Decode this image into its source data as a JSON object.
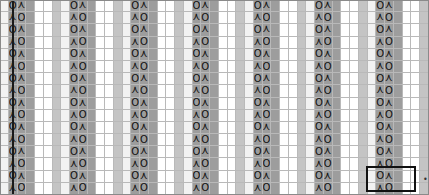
{
  "chart": {
    "type": "knitting-chart",
    "grid": {
      "columns": 49,
      "rows": 16,
      "cell_width_px": 8.75,
      "cell_height_px": 12.1875,
      "gridline_color": "#b9b9b9",
      "border_color": "#8a8a8a"
    },
    "repeat": {
      "width_columns": 7,
      "count": 7,
      "boundary_marker_x_px": 12,
      "boundary_marker_color": "#1a1a1a",
      "boundary_marker_width_px": 2
    },
    "colors": {
      "white": "#ffffff",
      "light": "#f2f2f2",
      "medium": "#c4c4c4",
      "dark": "#9d9d9d",
      "glyph": "#111111",
      "selection": "#111111"
    },
    "symbols": {
      "yarn_over": {
        "name": "yarn-over",
        "glyph": "O",
        "label": "O"
      },
      "decrease": {
        "name": "decrease",
        "glyph": "⋏",
        "label": "⋏"
      },
      "blank": {
        "name": "knit-blank",
        "glyph": "",
        "label": ""
      }
    },
    "column_shades": [
      "light",
      "dark",
      "dark",
      "dark",
      "white",
      "white",
      "medium"
    ],
    "row_patterns": {
      "odd": [
        "",
        "O",
        "dec",
        "",
        "",
        "",
        ""
      ],
      "even": [
        "",
        "dec",
        "O",
        "",
        "",
        "",
        ""
      ]
    },
    "rows": [
      {
        "index": 1,
        "parity": "odd"
      },
      {
        "index": 2,
        "parity": "even"
      },
      {
        "index": 3,
        "parity": "odd"
      },
      {
        "index": 4,
        "parity": "even"
      },
      {
        "index": 5,
        "parity": "odd"
      },
      {
        "index": 6,
        "parity": "even"
      },
      {
        "index": 7,
        "parity": "odd"
      },
      {
        "index": 8,
        "parity": "even"
      },
      {
        "index": 9,
        "parity": "odd"
      },
      {
        "index": 10,
        "parity": "even"
      },
      {
        "index": 11,
        "parity": "odd"
      },
      {
        "index": 12,
        "parity": "even"
      },
      {
        "index": 13,
        "parity": "odd"
      },
      {
        "index": 14,
        "parity": "even"
      },
      {
        "index": 15,
        "parity": "odd"
      },
      {
        "index": 16,
        "parity": "even"
      }
    ],
    "selection": {
      "name": "selection-box",
      "x_px": 366,
      "y_px": 166,
      "width_px": 50,
      "height_px": 26,
      "border_px": 2,
      "label": ""
    },
    "edge_marker": {
      "name": "edge-tick-marker",
      "glyph": "•",
      "x_px": 423,
      "y_px": 176
    }
  }
}
